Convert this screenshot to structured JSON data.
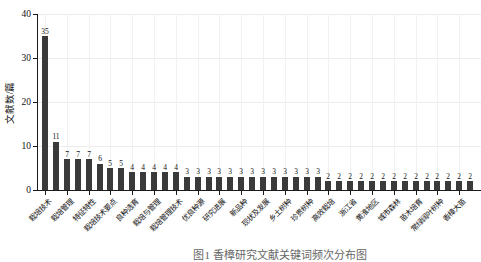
{
  "chart_data": {
    "type": "bar",
    "title": "",
    "xlabel": "",
    "ylabel": "文献数/篇",
    "ylim": [
      0,
      40
    ],
    "yticks": [
      0,
      10,
      20,
      30,
      40
    ],
    "grid": true,
    "legend": "none",
    "bar_color": "#3a3a3a",
    "values": [
      35,
      11,
      7,
      7,
      7,
      6,
      5,
      5,
      4,
      4,
      4,
      4,
      4,
      3,
      3,
      3,
      3,
      3,
      3,
      3,
      3,
      3,
      3,
      3,
      3,
      3,
      2,
      2,
      2,
      2,
      2,
      2,
      2,
      2,
      2,
      2,
      2,
      2,
      2,
      2
    ],
    "tick_label_every": 2,
    "tick_labels": [
      "栽培技术",
      "栽培管理",
      "特征特性",
      "栽培技术要点",
      "良种选育",
      "栽培与管理",
      "栽培管理技术",
      "优良种源",
      "研究进展",
      "新品种",
      "现状及发展",
      "乡土树种",
      "珍贵树种",
      "高效栽培",
      "浙江省",
      "黄淮地区",
      "城市森林",
      "苗木培育",
      "常绿阔叶树种",
      "香樟大苗"
    ]
  },
  "caption": {
    "text": "图1 香樟研究文献关键词频次分布图"
  }
}
